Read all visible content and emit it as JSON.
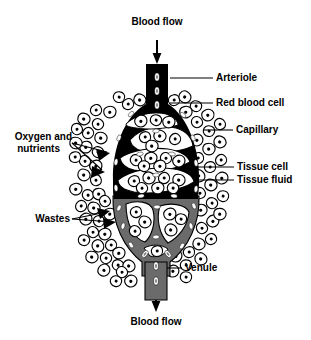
{
  "figure": {
    "title_visible": false,
    "background_color": "#ffffff",
    "ink_color": "#000000",
    "arteriole_color": "#000000",
    "venule_color": "#6b6b6b",
    "tissue_fluid_color": "#ffffff"
  },
  "labels": {
    "blood_flow_top": "Blood flow",
    "blood_flow_bottom": "Blood flow",
    "arteriole": "Arteriole",
    "red_blood_cell": "Red blood cell",
    "capillary": "Capillary",
    "tissue_cell": "Tissue cell",
    "tissue_fluid": "Tissue fluid",
    "oxygen_and_nutrients_line1": "Oxygen and",
    "oxygen_and_nutrients_line2": "nutrients",
    "wastes": "Wastes",
    "venule": "Venule"
  },
  "icons": {
    "arrow_down_top": "arrow-down-icon",
    "arrow_down_bottom": "arrow-down-icon",
    "arrowhead_oxygen_upper": "arrowhead-icon",
    "arrowhead_oxygen_lower": "arrowhead-icon",
    "arrowhead_wastes_upper": "arrowhead-icon",
    "arrowhead_wastes_lower": "arrowhead-icon"
  },
  "structures": [
    {
      "name": "arteriole",
      "description": "solid black vessel entering from top carrying red blood cells"
    },
    {
      "name": "capillary-bed",
      "description": "oval anastomosing network of capillaries surrounding tissue"
    },
    {
      "name": "venule",
      "description": "gray vessel exiting at bottom carrying red blood cells"
    },
    {
      "name": "tissue-cells",
      "description": "outlined cells with nuclei surrounding the capillary bed"
    },
    {
      "name": "tissue-fluid",
      "description": "white space between tissue cells and capillaries"
    }
  ]
}
